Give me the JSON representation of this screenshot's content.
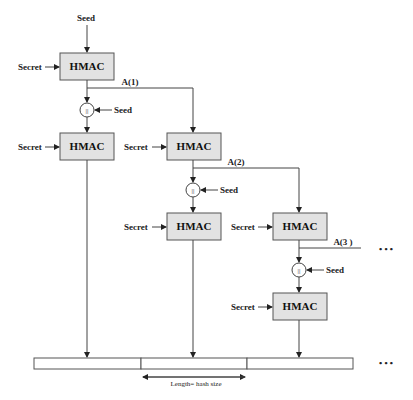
{
  "diagram": {
    "type": "flowchart",
    "title": "",
    "labels": {
      "seed": "Seed",
      "secret": "Secret",
      "hmac": "HMAC",
      "concat": "||",
      "a1": "A(1)",
      "a2": "A(2)",
      "a3": "A(3 )",
      "ellipsis": "• • •",
      "length": "Length= hash size"
    },
    "nodes": [
      {
        "id": "hmac-a1",
        "label": "HMAC",
        "inputs": [
          "Secret",
          "Seed"
        ],
        "output": "A(1)"
      },
      {
        "id": "hmac-out1",
        "label": "HMAC",
        "inputs": [
          "Secret",
          "A(1) || Seed"
        ]
      },
      {
        "id": "hmac-a2",
        "label": "HMAC",
        "inputs": [
          "Secret",
          "A(1)"
        ],
        "output": "A(2)"
      },
      {
        "id": "hmac-out2",
        "label": "HMAC",
        "inputs": [
          "Secret",
          "A(2) || Seed"
        ]
      },
      {
        "id": "hmac-a3",
        "label": "HMAC",
        "inputs": [
          "Secret",
          "A(2)"
        ],
        "output": "A(3)"
      },
      {
        "id": "hmac-out3",
        "label": "HMAC",
        "inputs": [
          "Secret",
          "A(3) || Seed"
        ]
      }
    ],
    "output_segments": 3
  }
}
